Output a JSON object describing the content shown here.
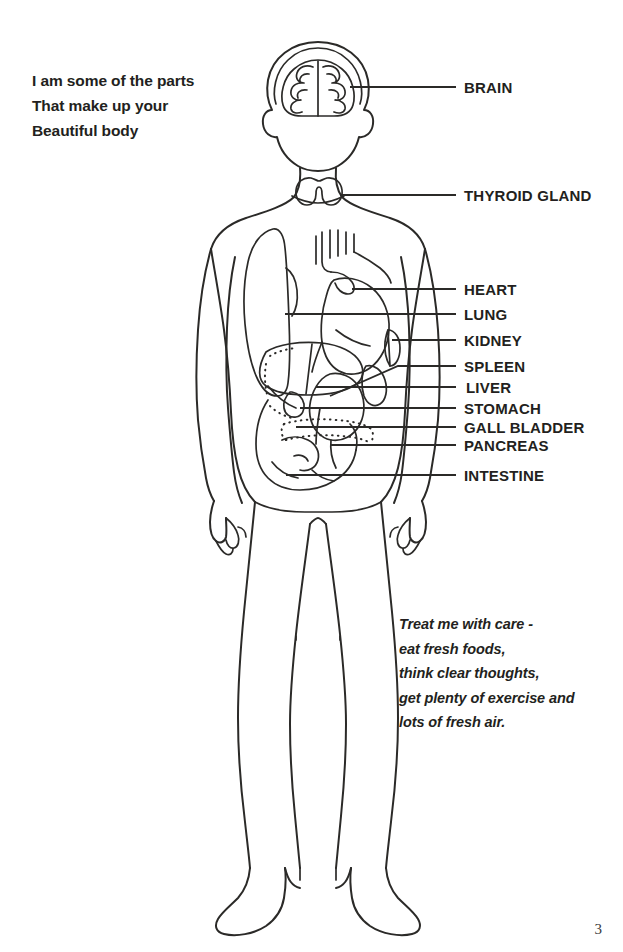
{
  "document": {
    "page_number": "3",
    "background_color": "#ffffff",
    "ink_color": "#2b2a28",
    "text_color": "#231f20"
  },
  "intro": {
    "line1": "I am some of the parts",
    "line2": "That make up your",
    "line3": "Beautiful body"
  },
  "advice": {
    "line1": "Treat me with care -",
    "line2": "eat fresh foods,",
    "line3": "think clear thoughts,",
    "line4": "get plenty of exercise and",
    "line5": "lots of fresh air."
  },
  "labels": [
    {
      "id": "brain",
      "text": "BRAIN",
      "x": 464,
      "y": 87
    },
    {
      "id": "thyroid",
      "text": "THYROID GLAND",
      "x": 464,
      "y": 195
    },
    {
      "id": "heart",
      "text": "HEART",
      "x": 464,
      "y": 289
    },
    {
      "id": "lung",
      "text": "LUNG",
      "x": 464,
      "y": 314
    },
    {
      "id": "kidney",
      "text": "KIDNEY",
      "x": 464,
      "y": 340
    },
    {
      "id": "spleen",
      "text": "SPLEEN",
      "x": 464,
      "y": 366
    },
    {
      "id": "liver",
      "text": "LIVER",
      "x": 466,
      "y": 387
    },
    {
      "id": "stomach",
      "text": "STOMACH",
      "x": 464,
      "y": 408
    },
    {
      "id": "gall-bladder",
      "text": "GALL BLADDER",
      "x": 464,
      "y": 427
    },
    {
      "id": "pancreas",
      "text": "PANCREAS",
      "x": 464,
      "y": 445
    },
    {
      "id": "intestine",
      "text": "INTESTINE",
      "x": 464,
      "y": 475
    }
  ],
  "figure": {
    "organs": [
      "brain",
      "thyroid gland",
      "heart",
      "lung",
      "kidney",
      "spleen",
      "liver",
      "stomach",
      "gall bladder",
      "pancreas",
      "intestine"
    ]
  }
}
